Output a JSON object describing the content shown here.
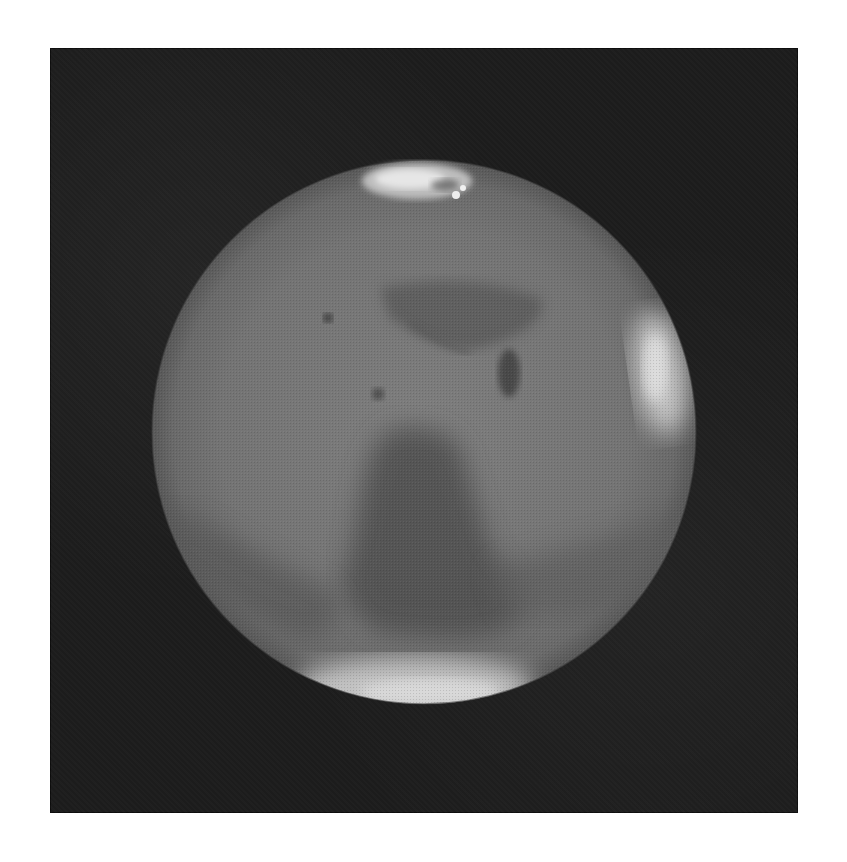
{
  "image": {
    "subject": "Mars",
    "description": "Grayscale telescopic image of Mars against a dark background",
    "frame_color": "#1c1c1c",
    "page_background": "#ffffff",
    "planet": {
      "center": [
        424,
        432
      ],
      "radius": 272,
      "base_color": "#7a7a7a",
      "features": [
        {
          "name": "north-polar-cap",
          "tone": "bright"
        },
        {
          "name": "south-polar-cap",
          "tone": "bright"
        },
        {
          "name": "east-limb-cloud",
          "tone": "bright"
        },
        {
          "name": "central-dark-albedo-region",
          "tone": "dark"
        },
        {
          "name": "northern-dark-markings",
          "tone": "dark"
        }
      ]
    }
  }
}
